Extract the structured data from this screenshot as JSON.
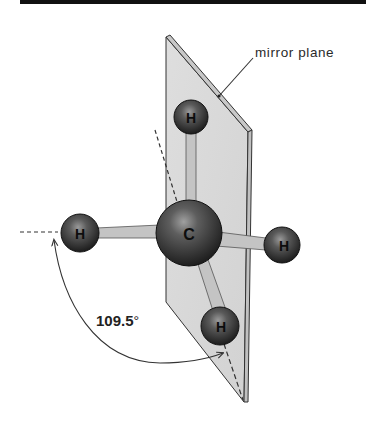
{
  "figure": {
    "top_rule_color": "#111111",
    "plane_color": "#d9d9d9",
    "atom_color": "#2b2b2b",
    "bond_color": "#c4c4c4"
  },
  "labels": {
    "mirror_plane": "mirror plane",
    "angle_value": "109.5",
    "angle_unit": "°"
  },
  "atoms": [
    {
      "symbol": "C",
      "role": "central-carbon",
      "cx": 189,
      "cy": 233,
      "r": 33
    },
    {
      "symbol": "H",
      "role": "top-hydrogen",
      "cx": 191,
      "cy": 117,
      "r": 17
    },
    {
      "symbol": "H",
      "role": "left-hydrogen",
      "cx": 80,
      "cy": 233,
      "r": 19
    },
    {
      "symbol": "H",
      "role": "right-hydrogen",
      "cx": 282,
      "cy": 245,
      "r": 18
    },
    {
      "symbol": "H",
      "role": "bottom-hydrogen",
      "cx": 220,
      "cy": 326,
      "r": 19
    }
  ]
}
